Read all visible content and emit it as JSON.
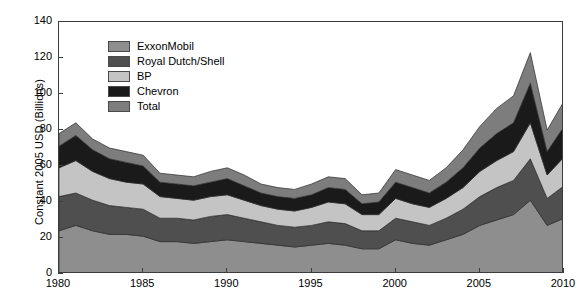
{
  "chart_data": {
    "type": "area",
    "stacked": true,
    "title": "",
    "xlabel": "",
    "ylabel": "Constant 2005 USD (Billions)",
    "xlim": [
      1980,
      2010
    ],
    "ylim": [
      0,
      140
    ],
    "ytick_values": [
      0,
      20,
      40,
      60,
      80,
      100,
      120,
      140
    ],
    "ytick_labels": [
      "0",
      "20",
      "40",
      "60",
      "80",
      "100",
      "120",
      "140"
    ],
    "xtick_values": [
      1980,
      1985,
      1990,
      1995,
      2000,
      2005,
      2010
    ],
    "xtick_labels": [
      "1980",
      "1985",
      "1990",
      "1995",
      "2000",
      "2005",
      "2010"
    ],
    "grid": false,
    "legend_position": "upper-left-inside",
    "x": [
      1980,
      1981,
      1982,
      1983,
      1984,
      1985,
      1986,
      1987,
      1988,
      1989,
      1990,
      1991,
      1992,
      1993,
      1994,
      1995,
      1996,
      1997,
      1998,
      1999,
      2000,
      2001,
      2002,
      2003,
      2004,
      2005,
      2006,
      2007,
      2008,
      2009,
      2010
    ],
    "series": [
      {
        "name": "ExxonMobil",
        "color": "#8e8e8e",
        "values": [
          24,
          27,
          24,
          22,
          22,
          21,
          18,
          18,
          17,
          18,
          19,
          18,
          17,
          16,
          15,
          16,
          17,
          16,
          14,
          14,
          19,
          17,
          16,
          19,
          22,
          27,
          30,
          33,
          41,
          27,
          31
        ]
      },
      {
        "name": "Royal Dutch/Shell",
        "color": "#4f4f4f",
        "values": [
          19,
          18,
          17,
          16,
          15,
          15,
          13,
          13,
          13,
          14,
          14,
          13,
          12,
          11,
          11,
          11,
          12,
          12,
          10,
          10,
          12,
          12,
          11,
          12,
          14,
          16,
          18,
          19,
          23,
          15,
          18
        ]
      },
      {
        "name": "BP",
        "color": "#c4c4c4",
        "values": [
          16,
          18,
          16,
          15,
          14,
          14,
          12,
          11,
          11,
          11,
          11,
          10,
          9,
          9,
          9,
          10,
          11,
          11,
          9,
          9,
          11,
          10,
          10,
          11,
          12,
          14,
          15,
          16,
          20,
          13,
          16
        ]
      },
      {
        "name": "Chevron",
        "color": "#1a1a1a",
        "values": [
          12,
          14,
          12,
          11,
          11,
          10,
          8,
          8,
          8,
          8,
          9,
          8,
          7,
          7,
          7,
          7,
          8,
          8,
          6,
          7,
          9,
          9,
          8,
          9,
          11,
          13,
          15,
          16,
          22,
          13,
          17
        ]
      },
      {
        "name": "Total",
        "color": "#7d7d7d",
        "values": [
          7,
          7,
          6,
          6,
          6,
          6,
          5,
          5,
          5,
          6,
          6,
          6,
          5,
          5,
          5,
          6,
          6,
          6,
          5,
          5,
          7,
          7,
          7,
          8,
          10,
          12,
          14,
          15,
          17,
          12,
          14
        ]
      }
    ]
  },
  "legend": {
    "items": [
      {
        "label": "ExxonMobil"
      },
      {
        "label": "Royal Dutch/Shell"
      },
      {
        "label": "BP"
      },
      {
        "label": "Chevron"
      },
      {
        "label": "Total"
      }
    ]
  }
}
